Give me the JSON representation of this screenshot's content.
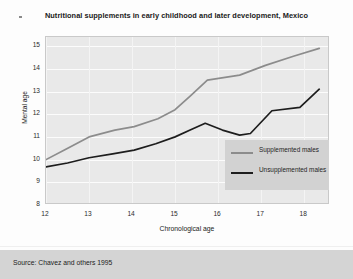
{
  "chart_data": {
    "type": "line",
    "title": "Nutritional supplements in early childhood and later development, Mexico",
    "xlabel": "Chronological age",
    "ylabel": "Mental age",
    "xlim": [
      12,
      18.6
    ],
    "ylim": [
      8,
      15.4
    ],
    "xticks": [
      "12",
      "13",
      "14",
      "15",
      "16",
      "17",
      "18"
    ],
    "yticks": [
      "15",
      "14",
      "13",
      "12",
      "11",
      "10",
      "9",
      "8"
    ],
    "grid": "both",
    "legend_position": "bottom-right",
    "series": [
      {
        "name": "Supplemented males",
        "color": "#8c8c8c",
        "points": [
          [
            12.0,
            10.0
          ],
          [
            12.45,
            10.45
          ],
          [
            13.0,
            11.0
          ],
          [
            13.6,
            11.3
          ],
          [
            14.05,
            11.45
          ],
          [
            14.6,
            11.8
          ],
          [
            15.0,
            12.2
          ],
          [
            15.35,
            12.8
          ],
          [
            15.75,
            13.5
          ],
          [
            16.5,
            13.72
          ],
          [
            17.1,
            14.15
          ],
          [
            17.75,
            14.55
          ],
          [
            18.35,
            14.9
          ]
        ]
      },
      {
        "name": "Unsupplemented males",
        "color": "#1d1d1d",
        "points": [
          [
            12.0,
            9.68
          ],
          [
            12.5,
            9.85
          ],
          [
            13.0,
            10.08
          ],
          [
            13.55,
            10.25
          ],
          [
            14.05,
            10.42
          ],
          [
            14.55,
            10.7
          ],
          [
            15.0,
            11.0
          ],
          [
            15.35,
            11.3
          ],
          [
            15.7,
            11.6
          ],
          [
            16.1,
            11.3
          ],
          [
            16.5,
            11.08
          ],
          [
            16.75,
            11.15
          ],
          [
            17.25,
            12.15
          ],
          [
            17.9,
            12.3
          ],
          [
            18.35,
            13.1
          ]
        ]
      }
    ]
  },
  "legend": {
    "items": [
      {
        "label": "Supplemented males",
        "color": "#8c8c8c"
      },
      {
        "label": "Unsupplemented males",
        "color": "#1d1d1d"
      }
    ]
  },
  "footer": {
    "source": "Source: Chavez and others 1995"
  },
  "colors": {
    "plot_background": "#e9e9e9",
    "gridline": "#fcfcfc",
    "legend_background": "#d2d2d2",
    "footer_background": "#d4d4d4",
    "supplemented": "#8c8c8c",
    "unsupplemented": "#1d1d1d"
  }
}
